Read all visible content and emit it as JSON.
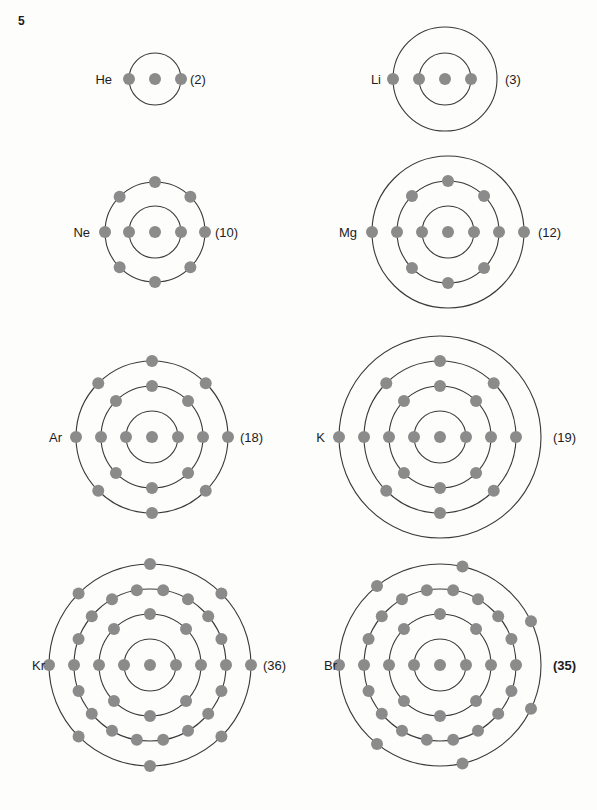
{
  "page": {
    "number": "5",
    "width": 597,
    "height": 810,
    "background_color": "#fdfdfc"
  },
  "style": {
    "ring_stroke_color": "#3a3a3a",
    "electron_color": "#8b8b8b",
    "nucleus_color": "#8b8b8b",
    "text_color": "#1c1c1c"
  },
  "chart_data": {
    "type": "diagram",
    "subtitle": "",
    "xlabel": "",
    "ylabel": "",
    "legend": [],
    "shell_radius_step_px": 25,
    "nucleus_radius_px": 6,
    "electron_radius_px": 6,
    "atoms": [
      {
        "symbol": "He",
        "atomic_number_label": "(2)",
        "atomic_number": 2,
        "shells": [
          2
        ],
        "shell_count": 1,
        "center": {
          "x": 155,
          "y": 79
        },
        "radii": [
          26
        ],
        "label_x": 112,
        "number_x": 190,
        "bold_number": false
      },
      {
        "symbol": "Li",
        "atomic_number_label": "(3)",
        "atomic_number": 3,
        "shells": [
          2,
          1
        ],
        "shell_count": 2,
        "center": {
          "x": 445,
          "y": 79
        },
        "radii": [
          26,
          52
        ],
        "label_x": 381,
        "number_x": 505,
        "bold_number": false
      },
      {
        "symbol": "Ne",
        "atomic_number_label": "(10)",
        "atomic_number": 10,
        "shells": [
          2,
          8
        ],
        "shell_count": 2,
        "center": {
          "x": 155,
          "y": 232
        },
        "radii": [
          26,
          50
        ],
        "label_x": 90,
        "number_x": 215,
        "bold_number": false
      },
      {
        "symbol": "Mg",
        "atomic_number_label": "(12)",
        "atomic_number": 12,
        "shells": [
          2,
          8,
          2
        ],
        "shell_count": 3,
        "center": {
          "x": 448,
          "y": 232
        },
        "radii": [
          26,
          51,
          76
        ],
        "label_x": 357,
        "number_x": 538,
        "bold_number": false
      },
      {
        "symbol": "Ar",
        "atomic_number_label": "(18)",
        "atomic_number": 18,
        "shells": [
          2,
          8,
          8
        ],
        "shell_count": 3,
        "center": {
          "x": 152,
          "y": 437
        },
        "radii": [
          26,
          51,
          76
        ],
        "label_x": 62,
        "number_x": 240,
        "bold_number": false
      },
      {
        "symbol": "K",
        "atomic_number_label": "(19)",
        "atomic_number": 19,
        "shells": [
          2,
          8,
          8,
          1
        ],
        "shell_count": 4,
        "center": {
          "x": 440,
          "y": 437
        },
        "radii": [
          26,
          51,
          76,
          101
        ],
        "label_x": 325,
        "number_x": 553,
        "bold_number": false
      },
      {
        "symbol": "Kr",
        "atomic_number_label": "(36)",
        "atomic_number": 36,
        "shells": [
          2,
          8,
          18,
          8
        ],
        "shell_count": 4,
        "center": {
          "x": 150,
          "y": 665
        },
        "radii": [
          26,
          51,
          76,
          101
        ],
        "label_x": 45,
        "number_x": 263,
        "bold_number": false
      },
      {
        "symbol": "Br",
        "atomic_number_label": "(35)",
        "atomic_number": 35,
        "shells": [
          2,
          8,
          18,
          7
        ],
        "shell_count": 4,
        "center": {
          "x": 440,
          "y": 665
        },
        "radii": [
          26,
          51,
          76,
          101
        ],
        "label_x": 337,
        "number_x": 553,
        "bold_number": true
      }
    ]
  }
}
